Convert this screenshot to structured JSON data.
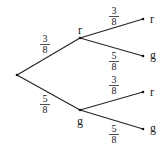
{
  "diagram": {
    "type": "probability-tree",
    "root": {
      "label": ""
    },
    "level1": [
      {
        "id": "r",
        "label": "r",
        "prob": {
          "num": "3",
          "den": "8"
        }
      },
      {
        "id": "g",
        "label": "g",
        "prob": {
          "num": "5",
          "den": "8"
        }
      }
    ],
    "level2": [
      {
        "parent": "r",
        "label": "r",
        "prob": {
          "num": "3",
          "den": "8"
        }
      },
      {
        "parent": "r",
        "label": "g",
        "prob": {
          "num": "5",
          "den": "8"
        }
      },
      {
        "parent": "g",
        "label": "r",
        "prob": {
          "num": "3",
          "den": "8"
        }
      },
      {
        "parent": "g",
        "label": "g",
        "prob": {
          "num": "5",
          "den": "8"
        }
      }
    ]
  }
}
